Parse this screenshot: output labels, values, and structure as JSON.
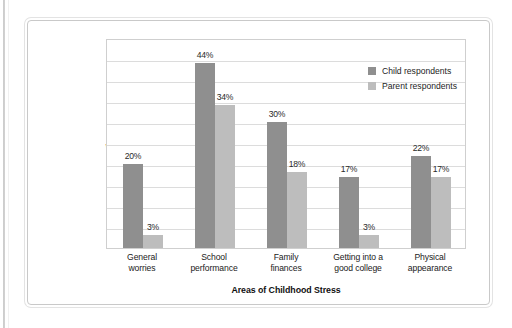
{
  "chart_data": {
    "type": "bar",
    "title": "",
    "xlabel": "Areas of Childhood Stress",
    "ylabel": "Percentage of Respondents Who Say Child Experiences Stress",
    "ylim": [
      0,
      50
    ],
    "grid": true,
    "grid_step": 5,
    "legend_position": "top-right-inside",
    "categories": [
      "General worries",
      "School performance",
      "Family finances",
      "Getting into a good college",
      "Physical appearance"
    ],
    "category_lines": [
      [
        "General",
        "worries"
      ],
      [
        "School",
        "performance"
      ],
      [
        "Family",
        "finances"
      ],
      [
        "Getting into a",
        "good college"
      ],
      [
        "Physical",
        "appearance"
      ]
    ],
    "series": [
      {
        "name": "Child respondents",
        "color": "#8f8f8f",
        "values": [
          20,
          44,
          30,
          17,
          22
        ],
        "labels": [
          "20%",
          "44%",
          "30%",
          "17%",
          "22%"
        ]
      },
      {
        "name": "Parent respondents",
        "color": "#bdbdbd",
        "values": [
          3,
          34,
          18,
          3,
          17
        ],
        "labels": [
          "3%",
          "34%",
          "18%",
          "3%",
          "17%"
        ]
      }
    ]
  },
  "axis": {
    "y_title_lines": [
      "Percentage of",
      "Respondents",
      "Who Say Child",
      "Experiences",
      "Stress"
    ],
    "x_title": "Areas of Childhood Stress"
  },
  "legend": {
    "items": [
      {
        "label": "Child respondents",
        "color": "#8f8f8f"
      },
      {
        "label": "Parent respondents",
        "color": "#bdbdbd"
      }
    ]
  }
}
